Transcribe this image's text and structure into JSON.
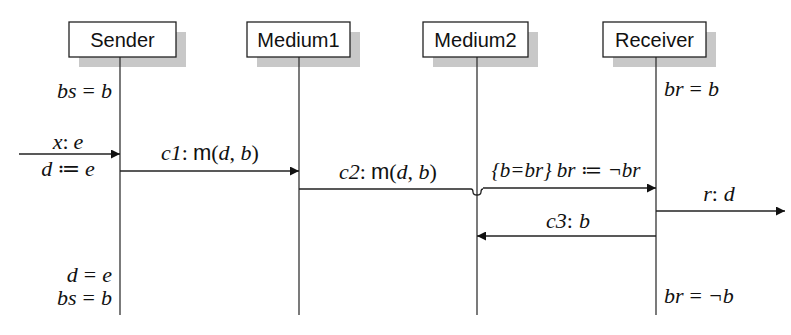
{
  "diagram": {
    "type": "sequence-diagram",
    "participants": [
      {
        "id": "sender",
        "label": "Sender",
        "x": 120,
        "box": [
          69,
          22,
          107,
          35
        ]
      },
      {
        "id": "medium1",
        "label": "Medium1",
        "x": 299,
        "box": [
          247,
          22,
          103,
          35
        ]
      },
      {
        "id": "medium2",
        "label": "Medium2",
        "x": 477,
        "box": [
          423,
          22,
          105,
          35
        ]
      },
      {
        "id": "receiver",
        "label": "Receiver",
        "x": 656,
        "box": [
          603,
          22,
          103,
          35
        ]
      }
    ],
    "lifeline_end_y": 315,
    "state_labels": {
      "sender_initial": "bs = b",
      "receiver_initial": "br = b",
      "sender_final_1": "d = e",
      "sender_final_2": "bs = b",
      "receiver_final": "br = ¬b"
    },
    "messages": [
      {
        "id": "input",
        "from": "environment",
        "to": "sender",
        "label_top": "x: e",
        "label_bottom": "d ≔ e",
        "y": 154
      },
      {
        "id": "c1",
        "from": "sender",
        "to": "medium1",
        "channel": "c1",
        "label": "c1: m(d, b)",
        "y": 171
      },
      {
        "id": "c2",
        "from": "medium1",
        "to": "receiver",
        "channel": "c2",
        "label": "c2: m(d, b)",
        "y": 189,
        "crosses": "medium2"
      },
      {
        "id": "guard",
        "from": "medium2",
        "to": "receiver",
        "label": "{b=br} br ≔ ¬br",
        "y": 188
      },
      {
        "id": "output",
        "from": "receiver",
        "to": "environment",
        "label": "r: d",
        "y": 211
      },
      {
        "id": "c3",
        "from": "receiver",
        "to": "medium2",
        "channel": "c3",
        "label": "c3: b",
        "y": 236
      }
    ]
  },
  "text": {
    "sender": "Sender",
    "medium1": "Medium1",
    "medium2": "Medium2",
    "receiver": "Receiver",
    "bs_init_lhs": "bs",
    "bs_init_rhs": "b",
    "br_init_lhs": "br",
    "br_init_rhs": "b",
    "x_label": "x",
    "e_label": "e",
    "d_label": "d",
    "assign": "≔",
    "eq": "=",
    "colon": ":",
    "c1_name": "c1",
    "c2_name": "c2",
    "c3_name": "c3",
    "m_fn": "m",
    "m_args_d": "d",
    "m_args_b": "b",
    "guard_text": "{b=br} br ≔ ¬br",
    "r_label": "r",
    "r_val": "d",
    "c3_val": "b",
    "final_d": "d",
    "final_e": "e",
    "final_bs": "bs",
    "final_b": "b",
    "final_br": "br",
    "final_notb": "¬b"
  }
}
